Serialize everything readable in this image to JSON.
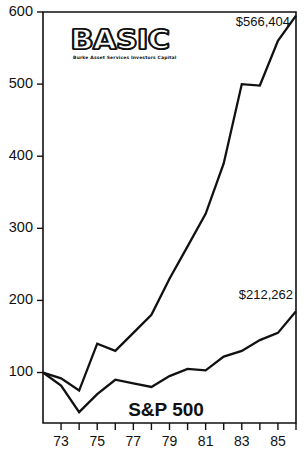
{
  "logo": {
    "wordmark": "BASIC",
    "tagline": "Burke Asset Services Investors Capital"
  },
  "annotations": {
    "basic_value": "$566,404",
    "sp500_value": "$212,262",
    "sp500_name": "S&P 500"
  },
  "chart_data": {
    "type": "line",
    "title": "",
    "subtitle": "",
    "xlabel": "",
    "ylabel": "",
    "grid": false,
    "legend_position": "inline-annotation",
    "xlim": [
      1972,
      1986
    ],
    "ylim": [
      30,
      600
    ],
    "x": [
      1972,
      1973,
      1974,
      1975,
      1976,
      1977,
      1978,
      1979,
      1980,
      1981,
      1982,
      1983,
      1984,
      1985,
      1986
    ],
    "x_tick_values": [
      1973,
      1974,
      1975,
      1976,
      1977,
      1978,
      1979,
      1980,
      1981,
      1982,
      1983,
      1984,
      1985,
      1986
    ],
    "x_tick_labels": [
      "73",
      "",
      "75",
      "",
      "77",
      "",
      "79",
      "",
      "81",
      "",
      "83",
      "",
      "85",
      ""
    ],
    "y_ticks": [
      100,
      200,
      300,
      400,
      500,
      600
    ],
    "y_tick_labels": [
      "100",
      "200",
      "300",
      "400",
      "500",
      "600"
    ],
    "series": [
      {
        "name": "BASIC",
        "end_label": "$566,404",
        "values": [
          100,
          92,
          75,
          140,
          130,
          155,
          180,
          230,
          275,
          320,
          390,
          500,
          498,
          560,
          595
        ]
      },
      {
        "name": "S&P 500",
        "end_label": "$212,262",
        "values": [
          100,
          82,
          45,
          70,
          90,
          85,
          80,
          95,
          105,
          103,
          122,
          130,
          145,
          155,
          185
        ]
      }
    ]
  },
  "colors": {
    "line": "#111111",
    "axis": "#111111",
    "background": "#ffffff"
  }
}
